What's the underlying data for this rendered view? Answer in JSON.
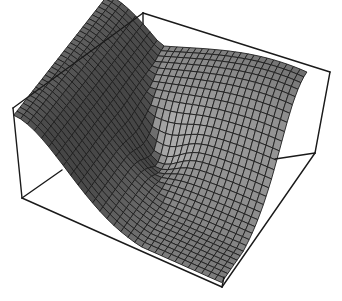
{
  "chart_data": {
    "type": "surface3d",
    "title": "",
    "xlabel": "",
    "ylabel": "",
    "zlabel": "",
    "axes_ticks": false,
    "boxed": true,
    "grid_resolution": 30,
    "surface_description": "Mesh surface high along the back-left and right edges, sloping down to a low plateau at the front corner, with a sharp fold/crease near the center",
    "surface_color": "#7a7a7a",
    "mesh_color": "#1e1e1e",
    "box_color": "#1a1a1a",
    "box_corners_px": {
      "top_back": [
        143,
        13
      ],
      "top_left": [
        13,
        108
      ],
      "top_right": [
        330,
        72
      ],
      "bottom_left": [
        22,
        198
      ],
      "bottom_front": [
        222,
        287
      ],
      "bottom_right": [
        315,
        153
      ]
    },
    "z_range": [
      0,
      1
    ]
  }
}
